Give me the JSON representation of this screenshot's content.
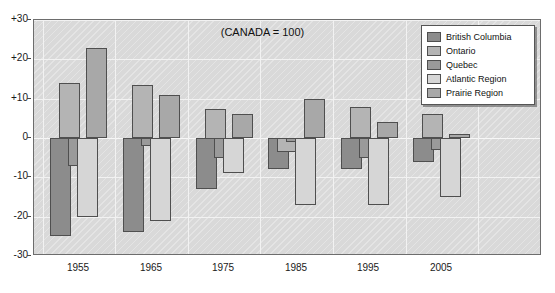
{
  "chart_data": {
    "type": "bar",
    "title": "(CANADA = 100)",
    "xlabel": "",
    "ylabel": "",
    "ylim": [
      -30,
      30
    ],
    "yticks": [
      "+30",
      "+20",
      "+10",
      "0",
      "-10",
      "-20",
      "-30"
    ],
    "ytick_values": [
      30,
      20,
      10,
      0,
      -10,
      -20,
      -30
    ],
    "grid": true,
    "legend_position": "top-right",
    "categories": [
      "1955",
      "1965",
      "1975",
      "1985",
      "1995",
      "2005"
    ],
    "series": [
      {
        "name": "British Columbia",
        "color": "#8c8c8c",
        "values": [
          -25,
          -24,
          -13,
          -8,
          -8,
          -6
        ]
      },
      {
        "name": "Ontario",
        "color": "#b4b4b4",
        "values": [
          14,
          13.5,
          7.5,
          -3.5,
          8,
          6
        ]
      },
      {
        "name": "Quebec",
        "color": "#9a9a9a",
        "values": [
          -7,
          -2,
          -5,
          -1,
          -5,
          -3
        ]
      },
      {
        "name": "Atlantic Region",
        "color": "#d6d6d6",
        "values": [
          -20,
          -21,
          -9,
          -17,
          -17,
          -15
        ]
      },
      {
        "name": "Prairie Region",
        "color": "#a8a8a8",
        "values": [
          23,
          11,
          6,
          10,
          4,
          1
        ]
      }
    ]
  },
  "legend": {
    "items": [
      {
        "label": "British Columbia"
      },
      {
        "label": "Ontario"
      },
      {
        "label": "Quebec"
      },
      {
        "label": "Atlantic Region"
      },
      {
        "label": "Prairie Region"
      }
    ]
  },
  "colors": {
    "plot_background": "#d9d9d9",
    "grid": "#f2f2f2",
    "axis": "#6d6d6d",
    "bar_outline": "#4f4f4f"
  }
}
